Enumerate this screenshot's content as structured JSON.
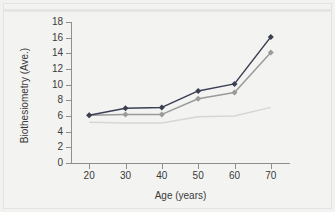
{
  "chart_data": {
    "type": "line",
    "title": "",
    "xlabel": "Age (years)",
    "ylabel": "Biothesiometry (Ave.)",
    "x": [
      20,
      30,
      40,
      50,
      60,
      70
    ],
    "xlim": [
      15,
      75
    ],
    "ylim": [
      0,
      18
    ],
    "xticks": [
      "20",
      "30",
      "40",
      "50",
      "60",
      "70"
    ],
    "yticks": [
      "0",
      "2",
      "4",
      "6",
      "8",
      "10",
      "12",
      "14",
      "16",
      "18"
    ],
    "grid": false,
    "legend": "none",
    "series": [
      {
        "name": "dark-series",
        "color": "#3a3f52",
        "marker": "diamond",
        "values": [
          6.1,
          7.0,
          7.1,
          9.2,
          10.1,
          16.1
        ]
      },
      {
        "name": "mid-gray-series",
        "color": "#9a9a9a",
        "marker": "diamond",
        "values": [
          6.1,
          6.2,
          6.2,
          8.2,
          9.0,
          14.1
        ]
      },
      {
        "name": "light-gray-series",
        "color": "#d6d6d6",
        "marker": "none",
        "values": [
          5.2,
          5.1,
          5.1,
          5.9,
          6.0,
          7.1
        ]
      }
    ]
  },
  "axes": {
    "x_title": "Age (years)",
    "y_title": "Biothesiometry (Ave.)",
    "x_tick_labels": [
      "20",
      "30",
      "40",
      "50",
      "60",
      "70"
    ],
    "y_tick_labels": [
      "18",
      "16",
      "14",
      "12",
      "10",
      "8",
      "6",
      "4",
      "2",
      "0"
    ]
  },
  "colors": {
    "background": "#f2f2f1",
    "frame": "#e3e3e2",
    "axis": "#8e8e8e",
    "text": "#3a3a3a",
    "series_dark": "#3a3f52",
    "series_mid": "#9a9a9a",
    "series_light": "#d6d6d6"
  }
}
